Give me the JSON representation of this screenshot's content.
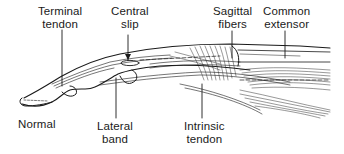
{
  "diagram": {
    "labels": [
      {
        "id": "terminal-tendon",
        "lines": [
          "Terminal",
          "tendon"
        ]
      },
      {
        "id": "central-slip",
        "lines": [
          "Central",
          "slip"
        ]
      },
      {
        "id": "sagittal-fibers",
        "lines": [
          "Sagittal",
          "fibers"
        ]
      },
      {
        "id": "common-extensor",
        "lines": [
          "Common",
          "extensor"
        ]
      },
      {
        "id": "normal",
        "lines": [
          "Normal"
        ]
      },
      {
        "id": "lateral-band",
        "lines": [
          "Lateral",
          "band"
        ]
      },
      {
        "id": "intrinsic-tendon",
        "lines": [
          "Intrinsic",
          "tendon"
        ]
      }
    ],
    "colors": {
      "ink": "#1a1a1a",
      "background": "#ffffff"
    }
  }
}
